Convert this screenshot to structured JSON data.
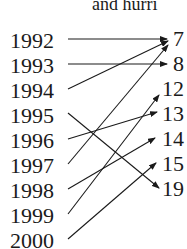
{
  "title": "and hurri",
  "years": [
    "1992",
    "1993",
    "1994",
    "1995",
    "1996",
    "1997",
    "1998",
    "1999",
    "2000"
  ],
  "values": [
    "7",
    "8",
    "12",
    "13",
    "14",
    "15",
    "19"
  ],
  "mapping": [
    {
      "from": "1992",
      "to": "7"
    },
    {
      "from": "1993",
      "to": "8"
    },
    {
      "from": "1994",
      "to": "7"
    },
    {
      "from": "1995",
      "to": "19"
    },
    {
      "from": "1996",
      "to": "13"
    },
    {
      "from": "1997",
      "to": "7"
    },
    {
      "from": "1998",
      "to": "14"
    },
    {
      "from": "1999",
      "to": "12"
    },
    {
      "from": "2000",
      "to": "15"
    }
  ]
}
